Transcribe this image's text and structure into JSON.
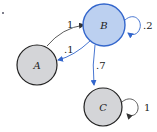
{
  "diagram": {
    "type": "markov-chain-state-diagram",
    "colors": {
      "highlight_fill": "#bcd0f0",
      "highlight_stroke": "#3366cc",
      "node_fill": "#d4d5d8",
      "node_stroke": "#222222",
      "edge_default": "#333333",
      "edge_highlight": "#3366cc"
    },
    "nodes": [
      {
        "id": "A",
        "label": "A",
        "highlighted": false
      },
      {
        "id": "B",
        "label": "B",
        "highlighted": true
      },
      {
        "id": "C",
        "label": "C",
        "highlighted": false
      }
    ],
    "edges": [
      {
        "from": "A",
        "to": "B",
        "label": "1",
        "highlighted": false
      },
      {
        "from": "B",
        "to": "A",
        "label": ".1",
        "highlighted": true
      },
      {
        "from": "B",
        "to": "C",
        "label": ".7",
        "highlighted": true
      },
      {
        "from": "B",
        "to": "B",
        "label": ".2",
        "highlighted": true
      },
      {
        "from": "C",
        "to": "C",
        "label": "1",
        "highlighted": false
      }
    ]
  }
}
